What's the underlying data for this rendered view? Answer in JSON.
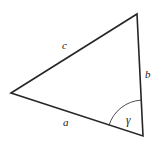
{
  "figure": {
    "kind": "triangle-diagram",
    "background_color": "#ffffff",
    "stroke_color": "#262626",
    "stroke_width": 1.6,
    "arc_stroke_color": "#3a3a3a",
    "arc_stroke_width": 0.9,
    "label_color": "#1a1a1a",
    "width": 160,
    "height": 152
  },
  "vertices": {
    "left": {
      "name": "left-vertex",
      "x": 11,
      "y": 93
    },
    "top_right": {
      "name": "top-right-vertex",
      "x": 137,
      "y": 14
    },
    "bottom_right": {
      "name": "bottom-right-vertex",
      "x": 143,
      "y": 136
    }
  },
  "sides": [
    {
      "id": "a",
      "label": "a",
      "label_x": 63,
      "label_y": 117,
      "from": "left",
      "to": "bottom_right"
    },
    {
      "id": "b",
      "label": "b",
      "label_x": 145,
      "label_y": 69,
      "from": "top_right",
      "to": "bottom_right"
    },
    {
      "id": "c",
      "label": "c",
      "label_x": 62,
      "label_y": 40,
      "from": "left",
      "to": "top_right"
    }
  ],
  "angles": [
    {
      "id": "gamma",
      "label": "γ",
      "label_x": 126,
      "label_y": 115,
      "at_vertex": "bottom_right",
      "arc_radius": 36
    }
  ],
  "geometry": {
    "triangle_path": "M 11 93 L 137 14 L 143 136 Z",
    "arc_path": "M 109.0 125.4 A 36 36 0 0 1 141.3 100.1"
  }
}
